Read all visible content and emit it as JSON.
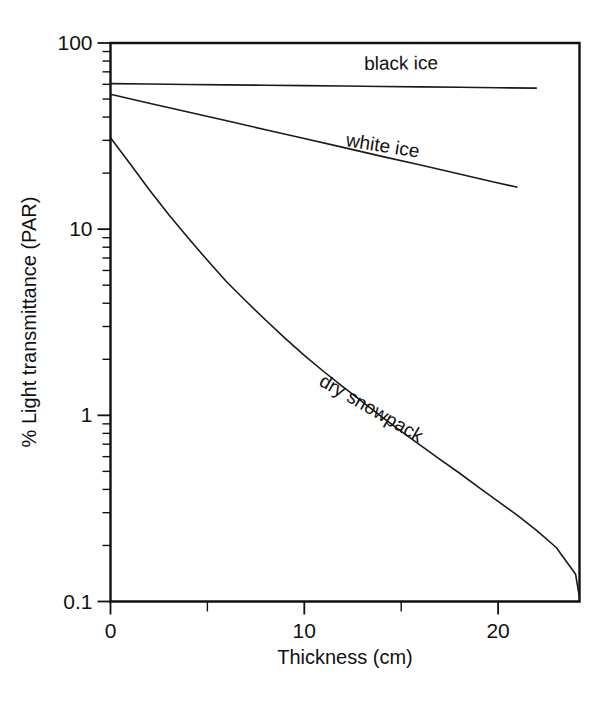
{
  "chart_data": {
    "type": "line",
    "title": "",
    "xlabel": "Thickness (cm)",
    "ylabel": "% Light transmittance (PAR)",
    "xlim": [
      0,
      24.2
    ],
    "ylim": [
      0.1,
      100
    ],
    "yscale": "log",
    "xscale": "linear",
    "grid": false,
    "legend_position": "inline-curve-labels",
    "x_ticks_major": [
      0,
      10,
      20
    ],
    "x_tick_labels": [
      "0",
      "10",
      "20"
    ],
    "x_ticks_minor": [
      5,
      15
    ],
    "y_ticks_major": [
      100,
      10,
      1,
      0.1
    ],
    "y_tick_labels": [
      "100",
      "10",
      "1",
      "0.1"
    ],
    "y_ticks_minor": [
      90,
      80,
      70,
      60,
      50,
      40,
      30,
      20,
      9,
      8,
      7,
      6,
      5,
      4,
      3,
      2,
      0.9,
      0.8,
      0.7,
      0.6,
      0.5,
      0.4,
      0.3,
      0.2
    ],
    "series": [
      {
        "name": "black ice",
        "label": "black ice",
        "label_x": 15.0,
        "label_y": 72,
        "label_rotation": -0.6,
        "x": [
          0,
          2,
          4,
          6,
          8,
          10,
          12,
          14,
          16,
          18,
          20,
          22
        ],
        "values": [
          60.5,
          60.2,
          59.9,
          59.6,
          59.3,
          59.0,
          58.7,
          58.4,
          58.1,
          57.8,
          57.5,
          57.2
        ]
      },
      {
        "name": "white ice",
        "label": "white ice",
        "label_x": 14.0,
        "label_y": 26,
        "label_rotation": 9.0,
        "x": [
          0,
          2,
          4,
          6,
          8,
          10,
          12,
          14,
          16,
          18,
          20,
          21
        ],
        "values": [
          53.0,
          47.5,
          42.6,
          38.2,
          34.2,
          30.7,
          27.5,
          24.6,
          22.1,
          19.8,
          17.7,
          16.8
        ]
      },
      {
        "name": "dry snowpack",
        "label": "dry snowpack",
        "label_x": 13.3,
        "label_y": 1.02,
        "label_rotation": 30.0,
        "x": [
          0,
          1,
          2,
          3,
          4,
          5,
          6,
          7,
          8,
          9,
          10,
          11,
          12,
          13,
          14,
          15,
          16,
          17,
          18,
          19,
          20,
          21,
          22,
          23,
          24,
          24.2
        ],
        "values": [
          31.0,
          22.5,
          16.3,
          12.0,
          9.0,
          6.8,
          5.2,
          4.1,
          3.25,
          2.6,
          2.1,
          1.72,
          1.42,
          1.18,
          0.98,
          0.82,
          0.69,
          0.58,
          0.49,
          0.41,
          0.345,
          0.29,
          0.24,
          0.195,
          0.14,
          0.105
        ]
      }
    ]
  },
  "axes": {
    "frame_color": "#111111",
    "line_color": "#1a1a1a"
  }
}
